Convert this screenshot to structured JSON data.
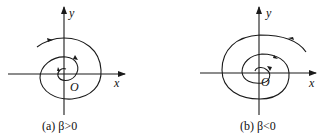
{
  "panels": [
    {
      "id": "a",
      "caption": "(a) β>0",
      "x_label": "x",
      "y_label": "y",
      "origin_label": "O",
      "description": "Outward spiral trajectory, clockwise direction"
    },
    {
      "id": "b",
      "caption": "(b) β<0",
      "x_label": "x",
      "y_label": "y",
      "origin_label": "O",
      "description": "Inward spiral trajectory, counter-clockwise direction"
    }
  ],
  "colors": {
    "ink": "#1a1a1a",
    "background": "#ffffff"
  }
}
